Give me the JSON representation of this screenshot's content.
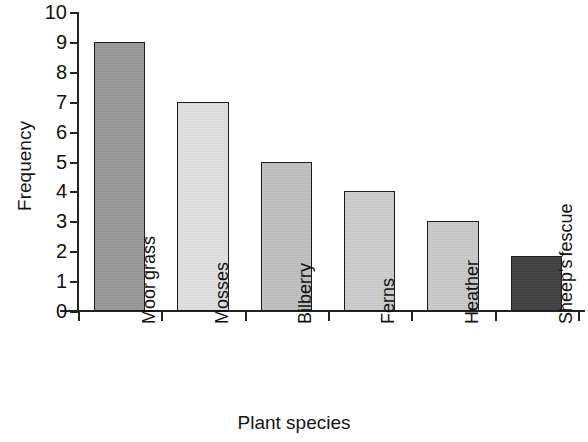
{
  "chart_data": {
    "type": "bar",
    "title": "",
    "xlabel": "Plant species",
    "ylabel": "Frequency",
    "categories": [
      "Moor grass",
      "Mosses",
      "Bilberry",
      "Ferns",
      "Heather",
      "Sheep's fescue"
    ],
    "category_lines": [
      [
        "Moor",
        "grass"
      ],
      [
        "Mosses"
      ],
      [
        "Bilberry"
      ],
      [
        "Ferns"
      ],
      [
        "Heather"
      ],
      [
        "Sheep's",
        "fescue"
      ]
    ],
    "values": [
      9,
      7,
      5,
      4,
      3,
      1.85
    ],
    "bar_colors": [
      "#9a9a9a",
      "#e3e3e3",
      "#c2c2c2",
      "#cfcfcf",
      "#cccccc",
      "#414141"
    ],
    "ylim": [
      0,
      10
    ],
    "ytick_labels": [
      "0",
      "1",
      "2",
      "3",
      "4",
      "5",
      "6",
      "7",
      "8",
      "9",
      "10"
    ],
    "ytick_values": [
      0,
      1,
      2,
      3,
      4,
      5,
      6,
      7,
      8,
      9,
      10
    ],
    "grid": false,
    "legend": "none",
    "bar_edge_color": "#1d1d1d",
    "axis_color": "#222222"
  }
}
